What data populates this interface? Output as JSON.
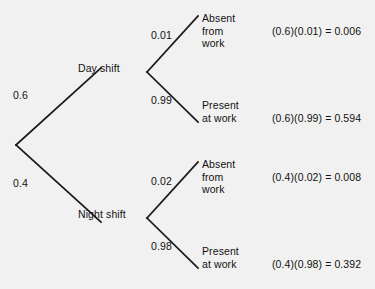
{
  "diagram": {
    "type": "probability-tree",
    "title": "",
    "root": {
      "branches": [
        {
          "probability": "0.6",
          "label": "Day shift",
          "branches": [
            {
              "probability": "0.01",
              "label": "Absent\nfrom\nwork",
              "equation": "(0.6)(0.01) = 0.006"
            },
            {
              "probability": "0.99",
              "label": "Present\nat work",
              "equation": "(0.6)(0.99) = 0.594"
            }
          ]
        },
        {
          "probability": "0.4",
          "label": "Night shift",
          "branches": [
            {
              "probability": "0.02",
              "label": "Absent\nfrom\nwork",
              "equation": "(0.4)(0.02) = 0.008"
            },
            {
              "probability": "0.98",
              "label": "Present\nat work",
              "equation": "(0.4)(0.98) = 0.392"
            }
          ]
        }
      ]
    },
    "colors": {
      "background": "#f1f1f1",
      "line": "#1a1a1a",
      "text": "#111111"
    }
  }
}
